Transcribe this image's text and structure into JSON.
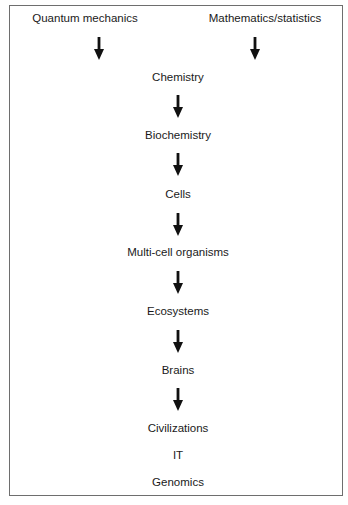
{
  "diagram": {
    "type": "hierarchy-flow",
    "sources": [
      {
        "label": "Quantum mechanics",
        "x": 85,
        "y": 19
      },
      {
        "label": "Mathematics/statistics",
        "x": 265,
        "y": 19
      }
    ],
    "nodes": [
      {
        "label": "Chemistry",
        "y": 78
      },
      {
        "label": "Biochemistry",
        "y": 136
      },
      {
        "label": "Cells",
        "y": 195
      },
      {
        "label": "Multi-cell organisms",
        "y": 253
      },
      {
        "label": "Ecosystems",
        "y": 312
      },
      {
        "label": "Brains",
        "y": 371
      },
      {
        "label": "Civilizations",
        "y": 429
      },
      {
        "label": "IT",
        "y": 456
      },
      {
        "label": "Genomics",
        "y": 483
      }
    ],
    "arrows": [
      {
        "from": "Quantum mechanics",
        "to": "Chemistry",
        "x": 99,
        "y": 37
      },
      {
        "from": "Mathematics/statistics",
        "to": "Chemistry",
        "x": 255,
        "y": 37
      },
      {
        "from": "Chemistry",
        "to": "Biochemistry",
        "x": 178,
        "y": 95
      },
      {
        "from": "Biochemistry",
        "to": "Cells",
        "x": 178,
        "y": 153
      },
      {
        "from": "Cells",
        "to": "Multi-cell organisms",
        "x": 178,
        "y": 213
      },
      {
        "from": "Multi-cell organisms",
        "to": "Ecosystems",
        "x": 178,
        "y": 271
      },
      {
        "from": "Ecosystems",
        "to": "Brains",
        "x": 178,
        "y": 330
      },
      {
        "from": "Brains",
        "to": "Civilizations",
        "x": 178,
        "y": 388
      }
    ],
    "colors": {
      "text": "#1a1a1a",
      "arrow": "#111111",
      "border": "#6e6e6e",
      "background": "#ffffff"
    }
  }
}
